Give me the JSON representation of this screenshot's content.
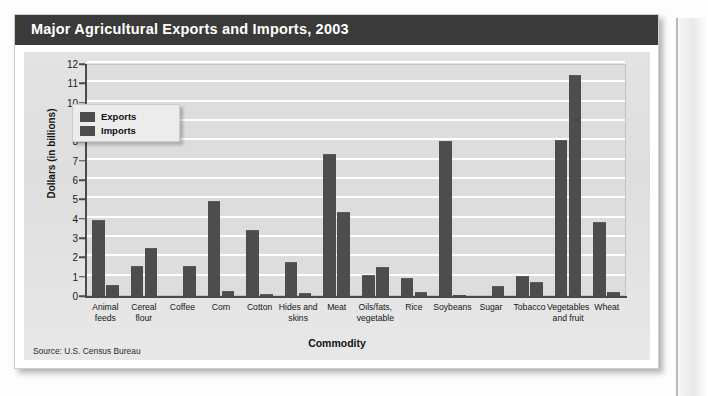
{
  "header": {
    "title": "Major Agricultural Exports and Imports, 2003"
  },
  "source": {
    "text": "Source: U.S. Census Bureau"
  },
  "legend": {
    "position": "inside-top-left",
    "entries": [
      {
        "label": "Exports",
        "color": "#4d4d4d"
      },
      {
        "label": "Imports",
        "color": "#4d4d4d"
      }
    ]
  },
  "colors": {
    "title_bar": "#3a3a3a",
    "title_text": "#ffffff",
    "plot_background": "#dddddd",
    "gridline": "#ffffff",
    "bar": "#4d4d4d",
    "axis": "#4a4a4a",
    "card_background": "#e3e3e3"
  },
  "chart_data": {
    "type": "bar",
    "title": "Major Agricultural Exports and Imports, 2003",
    "xlabel": "Commodity",
    "ylabel": "Dollars (in billions)",
    "ylim": [
      0,
      12
    ],
    "yticks": [
      0,
      1,
      2,
      3,
      4,
      5,
      6,
      7,
      8,
      9,
      10,
      11,
      12
    ],
    "ytick_labels": [
      "0",
      "1",
      "2",
      "3",
      "4",
      "5",
      "6",
      "7",
      "8",
      "9",
      "10",
      "11",
      "12"
    ],
    "grid": "horizontal",
    "legend_position": "inside-top-left",
    "units": "billions of U.S. dollars",
    "categories": [
      "Animal feeds",
      "Cereal flour",
      "Coffee",
      "Corn",
      "Cotton",
      "Hides and skins",
      "Meat",
      "Oils/fats, vegetable",
      "Rice",
      "Soybeans",
      "Sugar",
      "Tobacco",
      "Vegetables and fruit",
      "Wheat"
    ],
    "category_lines": [
      [
        "Animal",
        "feeds"
      ],
      [
        "Cereal",
        "flour"
      ],
      [
        "Coffee"
      ],
      [
        "Corn"
      ],
      [
        "Cotton"
      ],
      [
        "Hides and",
        "skins"
      ],
      [
        "Meat"
      ],
      [
        "Oils/fats,",
        "vegetable"
      ],
      [
        "Rice"
      ],
      [
        "Soybeans"
      ],
      [
        "Sugar"
      ],
      [
        "Tobacco"
      ],
      [
        "Vegetables",
        "and fruit"
      ],
      [
        "Wheat"
      ]
    ],
    "series": [
      {
        "name": "Exports",
        "color": "#4d4d4d",
        "values": [
          3.9,
          1.5,
          0.0,
          4.85,
          3.35,
          1.7,
          7.3,
          1.05,
          0.9,
          7.95,
          0.0,
          1.0,
          8.0,
          3.8
        ]
      },
      {
        "name": "Imports",
        "color": "#4d4d4d",
        "values": [
          0.5,
          2.45,
          1.5,
          0.2,
          0.05,
          0.1,
          4.3,
          1.45,
          0.15,
          0.03,
          0.45,
          0.65,
          11.4,
          0.15
        ]
      }
    ]
  }
}
